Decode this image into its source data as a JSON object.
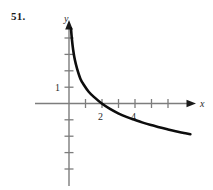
{
  "figure": {
    "problem_number": "51.",
    "background_color": "#ffffff",
    "curve_color": "#0d0d0d",
    "axis_color": "#7d7d7d",
    "text_color": "#2b2b2b"
  },
  "axes": {
    "x_axis_label": "x",
    "y_axis_label": "y",
    "x_tick_labels": [
      "2",
      "4"
    ],
    "y_tick_labels": [
      "1"
    ]
  },
  "chart_data": {
    "type": "line",
    "title": "",
    "xlabel": "x",
    "ylabel": "y",
    "grid": false,
    "legend": null,
    "axis_arrows": {
      "x_positive": true,
      "y_positive": true
    },
    "xlim": [
      -0.5,
      8.2
    ],
    "ylim": [
      -5.2,
      5.0
    ],
    "x_ticks": [
      1,
      2,
      3,
      4,
      5,
      6
    ],
    "x_tick_labels_shown": {
      "2": "2",
      "4": "4"
    },
    "y_ticks": [
      -4,
      -3,
      -2,
      -1,
      1,
      2,
      3,
      4
    ],
    "y_tick_labels_shown": {
      "1": "1"
    },
    "x_intercept": 2,
    "vertical_asymptote": 0,
    "series": [
      {
        "name": "curve",
        "x": [
          0.12,
          0.18,
          0.25,
          0.35,
          0.5,
          0.7,
          0.9,
          1.2,
          1.5,
          2.0,
          2.5,
          3.0,
          3.5,
          4.0,
          4.5,
          5.0,
          5.5,
          6.0,
          6.5,
          7.0,
          7.4
        ],
        "y": [
          4.6,
          3.9,
          3.3,
          2.7,
          2.1,
          1.5,
          1.15,
          0.72,
          0.42,
          0.0,
          -0.33,
          -0.6,
          -0.82,
          -1.0,
          -1.17,
          -1.32,
          -1.45,
          -1.58,
          -1.7,
          -1.8,
          -1.88
        ]
      }
    ]
  }
}
